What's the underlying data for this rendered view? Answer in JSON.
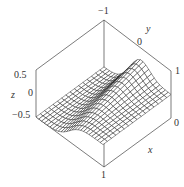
{
  "chart_data": {
    "type": "surface",
    "title": "",
    "xlabel": "x",
    "ylabel": "y",
    "zlabel": "z",
    "x_ticks": [
      "0",
      "1"
    ],
    "y_ticks": [
      "-1",
      "0",
      "1"
    ],
    "z_ticks": [
      "0.5",
      "0",
      "-0.5"
    ],
    "xlim": [
      0,
      1
    ],
    "ylim": [
      -1,
      1
    ],
    "zlim": [
      -0.5,
      0.5
    ],
    "grid": false,
    "style": "wireframe mesh, black lines on white"
  },
  "labels": {
    "y_tick_neg1": "−1",
    "y_tick_0": "0",
    "y_tick_1": "1",
    "y_axis": "y",
    "z_tick_pos": "0.5",
    "z_tick_0": "0",
    "z_tick_neg": "−0.5",
    "z_axis": "z",
    "x_tick_0": "0",
    "x_tick_1": "1",
    "x_axis": "x"
  }
}
